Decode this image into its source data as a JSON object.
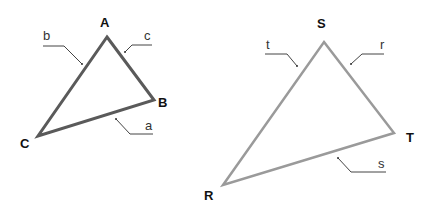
{
  "diagram": {
    "type": "two labeled triangles",
    "triangles": [
      {
        "name": "ABC",
        "stroke_color": "#5a5a5a",
        "vertices": [
          {
            "label": "A",
            "x": 107,
            "y": 37
          },
          {
            "label": "B",
            "x": 154,
            "y": 100
          },
          {
            "label": "C",
            "x": 38,
            "y": 136
          }
        ],
        "sides": [
          {
            "label": "a",
            "between": "B-C"
          },
          {
            "label": "b",
            "between": "A-C"
          },
          {
            "label": "c",
            "between": "A-B"
          }
        ]
      },
      {
        "name": "RST",
        "stroke_color": "#9a9a9a",
        "vertices": [
          {
            "label": "S",
            "x": 324,
            "y": 42
          },
          {
            "label": "T",
            "x": 394,
            "y": 133
          },
          {
            "label": "R",
            "x": 223,
            "y": 185
          }
        ],
        "sides": [
          {
            "label": "r",
            "between": "S-T"
          },
          {
            "label": "s",
            "between": "R-T"
          },
          {
            "label": "t",
            "between": "R-S"
          }
        ]
      }
    ]
  },
  "labels": {
    "A": "A",
    "B": "B",
    "C": "C",
    "a": "a",
    "b": "b",
    "c": "c",
    "S": "S",
    "T": "T",
    "R": "R",
    "r": "r",
    "s": "s",
    "t": "t"
  }
}
